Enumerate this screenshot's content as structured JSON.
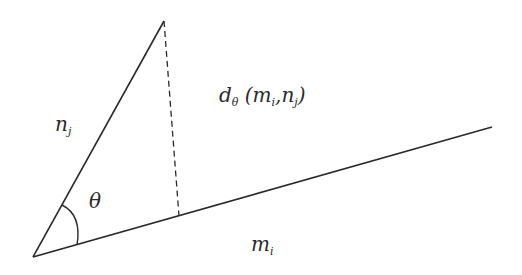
{
  "diagram": {
    "colors": {
      "stroke": "#2a2a2a",
      "background": "#ffffff"
    },
    "points": {
      "origin": [
        33,
        257
      ],
      "nj_end": [
        164,
        21
      ],
      "mi_end": [
        492,
        127
      ],
      "foot": [
        179,
        216
      ]
    },
    "labels": {
      "nj": {
        "main": "n",
        "sub": "j"
      },
      "mi": {
        "main": "m",
        "sub": "i"
      },
      "theta": "θ",
      "distance": {
        "main": "d",
        "sub": "θ",
        "open": " (",
        "arg1_main": "m",
        "arg1_sub": "i",
        "comma": ",",
        "arg2_main": "n",
        "arg2_sub": "j",
        "close": ")"
      }
    }
  }
}
